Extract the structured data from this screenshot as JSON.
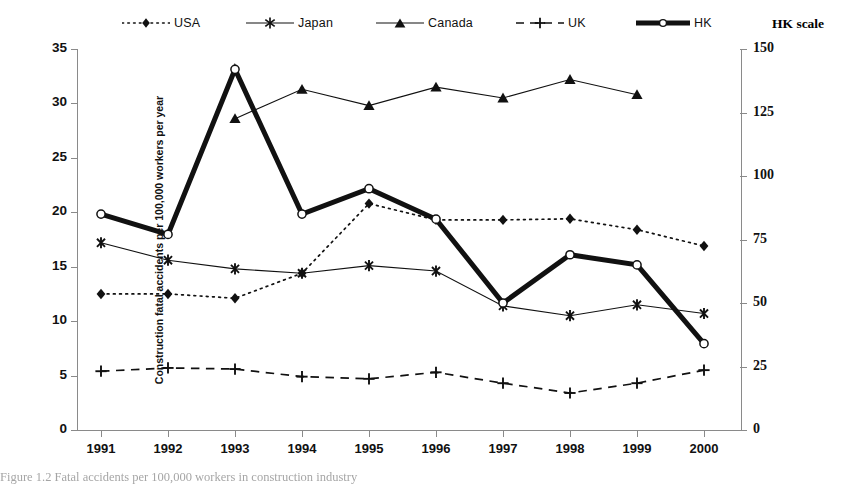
{
  "legend": {
    "entries": [
      {
        "key": "usa",
        "label": "USA",
        "style": "dotted",
        "marker": "diamond"
      },
      {
        "key": "japan",
        "label": "Japan",
        "style": "solid",
        "marker": "asterisk"
      },
      {
        "key": "canada",
        "label": "Canada",
        "style": "solid",
        "marker": "triangle"
      },
      {
        "key": "uk",
        "label": "UK",
        "style": "dashed",
        "marker": "plus"
      },
      {
        "key": "hk",
        "label": "HK",
        "style": "thick",
        "marker": "circle"
      }
    ],
    "right_scale_title": "HK scale"
  },
  "caption": "Figure 1.2  Fatal accidents per 100,000 workers in construction industry",
  "chart_data": {
    "type": "line",
    "title": "",
    "xlabel": "",
    "ylabel": "Construction fatal accidents per 100,000 workers per year",
    "y2label": "HK scale",
    "categories": [
      "1991",
      "1992",
      "1993",
      "1994",
      "1995",
      "1996",
      "1997",
      "1998",
      "1999",
      "2000"
    ],
    "ylim": [
      0,
      35
    ],
    "yticks": [
      0,
      5,
      10,
      15,
      20,
      25,
      30,
      35
    ],
    "y2lim": [
      0,
      150
    ],
    "y2ticks": [
      0,
      25,
      50,
      75,
      100,
      125,
      150
    ],
    "grid": false,
    "legend_position": "top",
    "series": [
      {
        "name": "USA",
        "axis": "left",
        "line_style": "dotted",
        "marker": "diamond",
        "values": [
          12.5,
          12.5,
          12.1,
          14.4,
          20.8,
          19.3,
          19.3,
          19.4,
          18.4,
          16.9
        ]
      },
      {
        "name": "Japan",
        "axis": "left",
        "line_style": "solid",
        "marker": "asterisk",
        "values": [
          17.2,
          15.6,
          14.8,
          14.4,
          15.1,
          14.6,
          11.4,
          10.5,
          11.5,
          10.7
        ]
      },
      {
        "name": "Canada",
        "axis": "left",
        "line_style": "solid",
        "marker": "triangle",
        "values": [
          null,
          null,
          28.6,
          31.3,
          29.8,
          31.5,
          30.5,
          32.2,
          30.8,
          null
        ]
      },
      {
        "name": "UK",
        "axis": "left",
        "line_style": "dashed",
        "marker": "plus",
        "values": [
          5.4,
          5.7,
          5.6,
          4.9,
          4.7,
          5.3,
          4.3,
          3.4,
          4.3,
          5.5
        ]
      },
      {
        "name": "HK",
        "axis": "right",
        "line_style": "thick",
        "marker": "circle",
        "values": [
          85,
          77,
          142,
          85,
          95,
          83,
          50,
          69,
          65,
          34
        ]
      }
    ]
  },
  "colors": {
    "line": "#111111",
    "axis": "#8a8a8a",
    "text": "#111111"
  }
}
